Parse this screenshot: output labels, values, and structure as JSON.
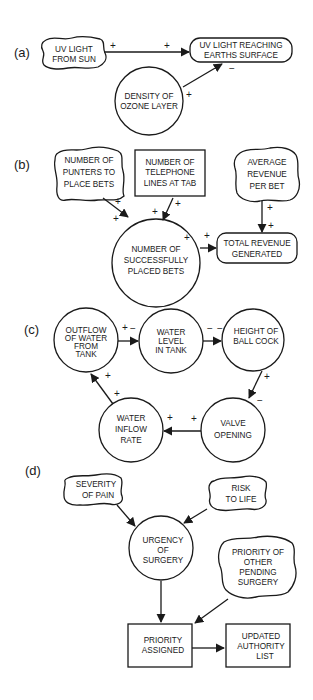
{
  "panels": {
    "a": {
      "label": "(a)",
      "nodes": {
        "uv_sun": [
          "UV LIGHT",
          "FROM SUN"
        ],
        "uv_earth": [
          "UV LIGHT REACHING",
          "EARTHS SURFACE"
        ],
        "ozone": [
          "DENSITY OF",
          "OZONE LAYER"
        ]
      },
      "signs": {
        "sun_out": "+",
        "earth_in": "+",
        "ozone_out": "+",
        "earth_in_ozone": "−"
      }
    },
    "b": {
      "label": "(b)",
      "nodes": {
        "punters": [
          "NUMBER OF",
          "PUNTERS TO",
          "PLACE BETS"
        ],
        "phones": [
          "NUMBER OF",
          "TELEPHONE",
          "LINES AT TAB"
        ],
        "average": [
          "AVERAGE",
          "REVENUE",
          "PER BET"
        ],
        "placed": [
          "NUMBER OF",
          "SUCCESSFULLY",
          "PLACED BETS"
        ],
        "total": [
          "TOTAL REVENUE",
          "GENERATED"
        ]
      },
      "signs": {
        "punters_out": "+",
        "punters_in": "+",
        "phones_out": "+",
        "phones_in": "+",
        "average_out": "+",
        "average_in": "+",
        "placed_out": "+",
        "total_in": "+"
      }
    },
    "c": {
      "label": "(c)",
      "nodes": {
        "outflow": [
          "OUTFLOW",
          "OF WATER",
          "FROM",
          "TANK"
        ],
        "level": [
          "WATER",
          "LEVEL",
          "IN TANK"
        ],
        "ballcock": [
          "HEIGHT OF",
          "BALL COCK"
        ],
        "valve": [
          "VALVE",
          "OPENING"
        ],
        "inflow": [
          "WATER",
          "INFLOW",
          "RATE"
        ]
      },
      "signs": {
        "outflow_out": "+",
        "level_in": "−",
        "level_out": "−",
        "ballcock_in": "−",
        "ballcock_out": "+",
        "valve_in": "−",
        "valve_out": "+",
        "inflow_in": "+",
        "inflow_out": "+",
        "outflow_in": "+"
      }
    },
    "d": {
      "label": "(d)",
      "nodes": {
        "severity": [
          "SEVERITY",
          "OF PAIN"
        ],
        "risk": [
          "RISK",
          "TO LIFE"
        ],
        "urgency": [
          "URGENCY",
          "OF",
          "SURGERY"
        ],
        "other": [
          "PRIORITY OF",
          "OTHER",
          "PENDING",
          "SURGERY"
        ],
        "assigned": [
          "PRIORITY",
          "ASSIGNED"
        ],
        "updated": [
          "UPDATED",
          "AUTHORITY",
          "LIST"
        ]
      }
    }
  }
}
